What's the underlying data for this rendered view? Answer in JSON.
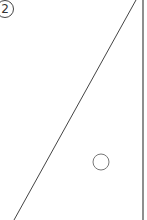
{
  "figure": {
    "label": "2",
    "colors": {
      "stroke": "#444444",
      "circle_stroke": "#777777",
      "background": "#ffffff"
    },
    "lines": {
      "hypotenuse": {
        "x1": 136,
        "y1": 0,
        "x2": 14,
        "y2": 220
      },
      "vertical_side": {
        "x1": 143,
        "y1": 0,
        "x2": 143,
        "y2": 220
      }
    },
    "circle": {
      "cx": 101,
      "cy": 162,
      "r": 8
    }
  }
}
